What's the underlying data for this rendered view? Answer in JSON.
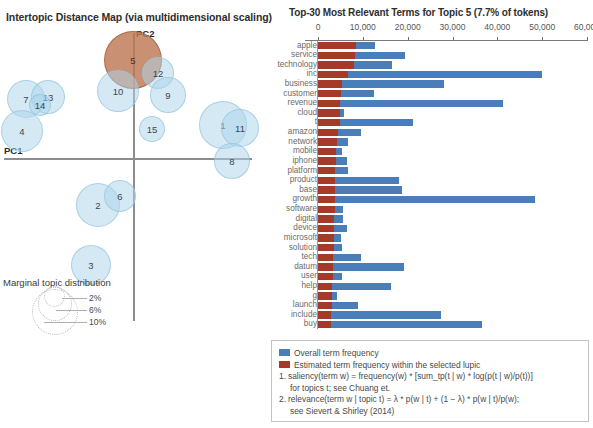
{
  "intertopic_map": {
    "title": "Intertopic Distance Map (via multidimensional scaling)",
    "axis_labels": {
      "x": "PC1",
      "y": "PC2"
    },
    "colors": {
      "bubble": "#add4ea",
      "selected_bubble": "#be7855"
    },
    "topics": [
      {
        "id": "5",
        "cx": 133,
        "cy": 60,
        "r": 29,
        "selected": true
      },
      {
        "id": "10",
        "cx": 118,
        "cy": 91,
        "r": 21,
        "selected": false
      },
      {
        "id": "12",
        "cx": 158,
        "cy": 73,
        "r": 16,
        "selected": false
      },
      {
        "id": "9",
        "cx": 168,
        "cy": 95,
        "r": 18,
        "selected": false
      },
      {
        "id": "7",
        "cx": 26,
        "cy": 99,
        "r": 19,
        "selected": false
      },
      {
        "id": "13",
        "cx": 48,
        "cy": 97,
        "r": 17,
        "selected": false
      },
      {
        "id": "14",
        "cx": 40,
        "cy": 105,
        "r": 11,
        "selected": false
      },
      {
        "id": "4",
        "cx": 22,
        "cy": 131,
        "r": 21,
        "selected": false
      },
      {
        "id": "15",
        "cx": 152,
        "cy": 129,
        "r": 13,
        "selected": false
      },
      {
        "id": "1",
        "cx": 223,
        "cy": 125,
        "r": 24,
        "selected": false
      },
      {
        "id": "11",
        "cx": 240,
        "cy": 128,
        "r": 19,
        "selected": false
      },
      {
        "id": "8",
        "cx": 232,
        "cy": 161,
        "r": 18,
        "selected": false
      },
      {
        "id": "2",
        "cx": 98,
        "cy": 205,
        "r": 22,
        "selected": false
      },
      {
        "id": "6",
        "cx": 120,
        "cy": 196,
        "r": 16,
        "selected": false
      },
      {
        "id": "3",
        "cx": 91,
        "cy": 265,
        "r": 20,
        "selected": false
      }
    ],
    "marginal_legend": {
      "title": "Marginal topic distribution",
      "sizes": [
        "2%",
        "6%",
        "10%"
      ]
    }
  },
  "bar_chart": {
    "title": "Top-30 Most Relevant Terms for Topic 5 (7.7% of tokens)",
    "legend": {
      "overall": "Overall term frequency",
      "topic": "Estimated term frequency within the selected lupic",
      "notes": [
        {
          "num": "1.",
          "line1": "saliency(term w) = frequency(w) * [sum_tp(t | w) * log(p(t | w)/p(t))]",
          "line2": "for topics t; see Chuang et."
        },
        {
          "num": "2.",
          "line1": "relevance(term w | topic t) = λ * p(w | t) + (1 − λ) * p(w | t)/p(w);",
          "line2": "see Sievert & Shirley (2014)"
        }
      ]
    }
  },
  "chart_data": {
    "type": "bar",
    "title": "Top-30 Most Relevant Terms for Topic 5 (7.7% of tokens)",
    "orientation": "horizontal",
    "xlabel": "",
    "ylabel": "",
    "xlim": [
      0,
      60000
    ],
    "xticks": [
      0,
      10000,
      20000,
      30000,
      40000,
      50000,
      60000
    ],
    "xtick_labels": [
      "0",
      "10,000",
      "20,000",
      "30,000",
      "40,000",
      "50,000",
      "60,000"
    ],
    "grid": false,
    "legend_position": "bottom",
    "categories": [
      "apple",
      "service",
      "technology",
      "inc",
      "business",
      "customer",
      "revenue",
      "cloud",
      "t",
      "amazon",
      "network",
      "mobile",
      "iphone",
      "platform",
      "product",
      "base",
      "growth",
      "software",
      "digital",
      "device",
      "microsoft",
      "solution",
      "tech",
      "datum",
      "user",
      "help",
      "g",
      "launch",
      "include",
      "buy"
    ],
    "series": [
      {
        "name": "Overall term frequency",
        "color": "#4a7ebb",
        "values": [
          12700,
          19400,
          16500,
          50000,
          28200,
          12500,
          41200,
          5700,
          21300,
          9600,
          6700,
          5300,
          6500,
          6800,
          18000,
          18700,
          48500,
          5600,
          5500,
          6400,
          5100,
          5300,
          9600,
          19200,
          5300,
          16300,
          4200,
          8900,
          27400,
          36500
        ]
      },
      {
        "name": "Estimated term frequency within the selected lupic",
        "color": "#a63a28",
        "values": [
          8400,
          8300,
          8000,
          6700,
          5400,
          5100,
          5000,
          5000,
          4800,
          4400,
          4200,
          4100,
          4000,
          3900,
          3900,
          3800,
          3800,
          3700,
          3600,
          3600,
          3500,
          3500,
          3400,
          3400,
          3300,
          3200,
          3100,
          3100,
          3000,
          3000
        ]
      }
    ]
  }
}
